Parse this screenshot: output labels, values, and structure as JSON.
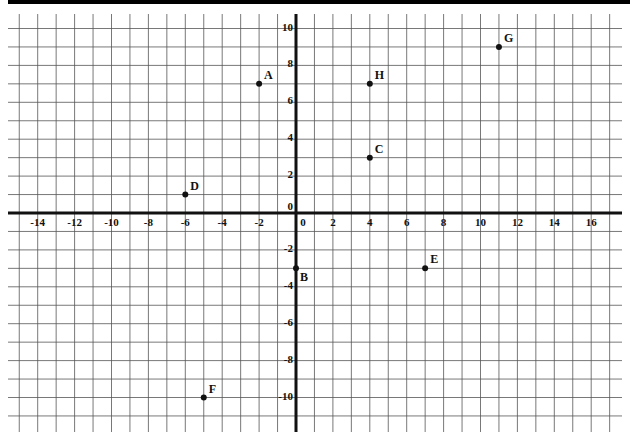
{
  "chart_data": {
    "type": "scatter",
    "title": "",
    "xlabel": "",
    "ylabel": "",
    "xlim": [
      -15.5,
      17
    ],
    "ylim": [
      -11.5,
      10.5
    ],
    "grid": true,
    "x_tick_labels": [
      "-14",
      "-12",
      "-10",
      "-8",
      "-6",
      "-4",
      "-2",
      "0",
      "2",
      "4",
      "6",
      "8",
      "10",
      "12",
      "14",
      "16"
    ],
    "y_tick_labels": [
      "10",
      "8",
      "6",
      "4",
      "2",
      "0",
      "-2",
      "-4",
      "-6",
      "-8",
      "-10"
    ],
    "points": [
      {
        "label": "A",
        "x": -2,
        "y": 7
      },
      {
        "label": "B",
        "x": 0,
        "y": -3
      },
      {
        "label": "C",
        "x": 4,
        "y": 3
      },
      {
        "label": "D",
        "x": -6,
        "y": 1
      },
      {
        "label": "E",
        "x": 7,
        "y": -3
      },
      {
        "label": "F",
        "x": -5,
        "y": -10
      },
      {
        "label": "G",
        "x": 11,
        "y": 9
      },
      {
        "label": "H",
        "x": 4,
        "y": 7
      }
    ],
    "colors": {
      "grid": "#555555",
      "axis": "#111111",
      "point": "#111111"
    }
  }
}
